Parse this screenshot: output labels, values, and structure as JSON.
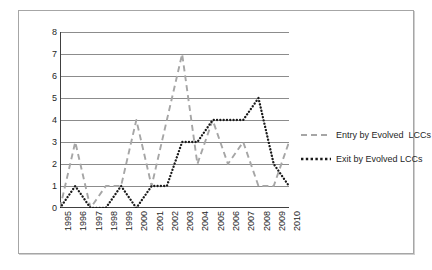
{
  "chart_data": {
    "type": "line",
    "title": "",
    "xlabel": "",
    "ylabel": "",
    "categories": [
      "1995",
      "1996",
      "1997",
      "1998",
      "1999",
      "2000",
      "2001",
      "2002",
      "2003",
      "2004",
      "2005",
      "2006",
      "2007",
      "2008",
      "2009",
      "2010"
    ],
    "xtick_labels": [
      "1995",
      "1996",
      "1997",
      "1998",
      "1999",
      "2000",
      "2001",
      "2002",
      "2003",
      "2004",
      "2005",
      "2006",
      "2007",
      "2008",
      "2009",
      "2010"
    ],
    "ytick_labels": [
      "0",
      "1",
      "2",
      "3",
      "4",
      "5",
      "6",
      "7",
      "8"
    ],
    "ylim": [
      0,
      8
    ],
    "ytick_step": 1,
    "grid": true,
    "grid_axis": "y",
    "legend_position": "right",
    "series": [
      {
        "name": "Entry by Evolved  LCCs",
        "style": "dashed",
        "color": "#a6a6a6",
        "values": [
          0,
          3,
          0,
          1,
          1,
          4,
          1,
          4,
          7,
          2,
          4,
          2,
          3,
          1,
          1,
          3
        ]
      },
      {
        "name": "Exit by Evolved LCCs",
        "style": "dotted",
        "color": "#1a1a1a",
        "values": [
          0,
          1,
          0,
          0,
          1,
          0,
          1,
          1,
          3,
          3,
          4,
          4,
          4,
          5,
          2,
          1
        ]
      }
    ]
  },
  "legend": {
    "entries": [
      {
        "label": "Entry by Evolved  LCCs"
      },
      {
        "label": "Exit by Evolved LCCs"
      }
    ]
  },
  "colors": {
    "entry_series": "#a6a6a6",
    "exit_series": "#1a1a1a",
    "grid": "#808080",
    "axis": "#404040",
    "frame": "#a6a6a6",
    "background": "#ffffff"
  }
}
